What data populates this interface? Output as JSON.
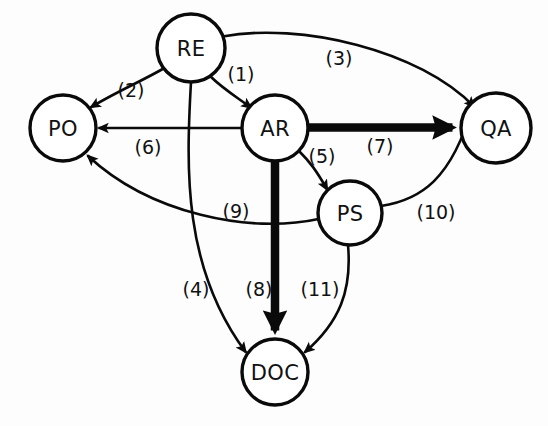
{
  "diagram": {
    "type": "directed-graph",
    "title": "",
    "background_color": "#fdfdfd",
    "stroke_color": "#0a0a0a",
    "node_fill_color": "#ffffff",
    "nodes": [
      {
        "id": "RE",
        "label": "RE",
        "cx": 191,
        "cy": 48,
        "r": 34
      },
      {
        "id": "PO",
        "label": "PO",
        "cx": 63,
        "cy": 128,
        "r": 33
      },
      {
        "id": "AR",
        "label": "AR",
        "cx": 275,
        "cy": 128,
        "r": 33
      },
      {
        "id": "QA",
        "label": "QA",
        "cx": 496,
        "cy": 128,
        "r": 35
      },
      {
        "id": "PS",
        "label": "PS",
        "cx": 350,
        "cy": 213,
        "r": 32
      },
      {
        "id": "DOC",
        "label": "DOC",
        "cx": 275,
        "cy": 372,
        "r": 33
      }
    ],
    "edges": [
      {
        "id": "e1",
        "label": "(1)",
        "from": "RE",
        "to": "AR",
        "weight": "thin",
        "label_x": 241,
        "label_y": 74
      },
      {
        "id": "e2",
        "label": "(2)",
        "from": "RE",
        "to": "PO",
        "weight": "thin",
        "label_x": 131,
        "label_y": 90
      },
      {
        "id": "e3",
        "label": "(3)",
        "from": "RE",
        "to": "QA",
        "weight": "thin",
        "label_x": 339,
        "label_y": 58
      },
      {
        "id": "e4",
        "label": "(4)",
        "from": "RE",
        "to": "DOC",
        "weight": "thin",
        "label_x": 196,
        "label_y": 289
      },
      {
        "id": "e5",
        "label": "(5)",
        "from": "AR",
        "to": "PS",
        "weight": "thin",
        "label_x": 322,
        "label_y": 156
      },
      {
        "id": "e6",
        "label": "(6)",
        "from": "AR",
        "to": "PO",
        "weight": "thin",
        "label_x": 148,
        "label_y": 147
      },
      {
        "id": "e7",
        "label": "(7)",
        "from": "AR",
        "to": "QA",
        "weight": "thick",
        "label_x": 380,
        "label_y": 146
      },
      {
        "id": "e8",
        "label": "(8)",
        "from": "AR",
        "to": "DOC",
        "weight": "thick",
        "label_x": 259,
        "label_y": 289
      },
      {
        "id": "e9",
        "label": "(9)",
        "from": "PS",
        "to": "PO",
        "weight": "thin",
        "label_x": 236,
        "label_y": 211
      },
      {
        "id": "e10",
        "label": "(10)",
        "from": "PS",
        "to": "QA",
        "weight": "thin",
        "label_x": 436,
        "label_y": 212
      },
      {
        "id": "e11",
        "label": "(11)",
        "from": "PS",
        "to": "DOC",
        "weight": "thin",
        "label_x": 320,
        "label_y": 289
      }
    ]
  }
}
